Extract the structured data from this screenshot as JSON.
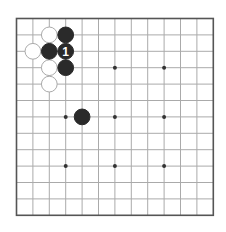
{
  "board": {
    "size": 13,
    "origin_x": 16.5,
    "origin_y": 18.5,
    "spacing": 16.4,
    "line_color": "#aaaaaa",
    "border_color": "#555555",
    "background": "#ffffff"
  },
  "star_points": [
    [
      3,
      3
    ],
    [
      6,
      3
    ],
    [
      9,
      3
    ],
    [
      3,
      6
    ],
    [
      6,
      6
    ],
    [
      9,
      6
    ],
    [
      3,
      9
    ],
    [
      6,
      9
    ],
    [
      9,
      9
    ]
  ],
  "stones": [
    {
      "color": "white",
      "col": 2,
      "row": 1
    },
    {
      "color": "white",
      "col": 1,
      "row": 2
    },
    {
      "color": "white",
      "col": 2,
      "row": 3
    },
    {
      "color": "white",
      "col": 2,
      "row": 4
    },
    {
      "color": "black",
      "col": 3,
      "row": 1
    },
    {
      "color": "black",
      "col": 2,
      "row": 2
    },
    {
      "color": "black",
      "col": 3,
      "row": 2,
      "label": "1"
    },
    {
      "color": "black",
      "col": 3,
      "row": 3
    },
    {
      "color": "black",
      "col": 4,
      "row": 6
    }
  ],
  "colors": {
    "black_stone": "#2a2a2a",
    "white_stone": "#ffffff",
    "white_stone_border": "#aaaaaa",
    "star_point": "#333333",
    "label_on_black": "#ffffff"
  }
}
